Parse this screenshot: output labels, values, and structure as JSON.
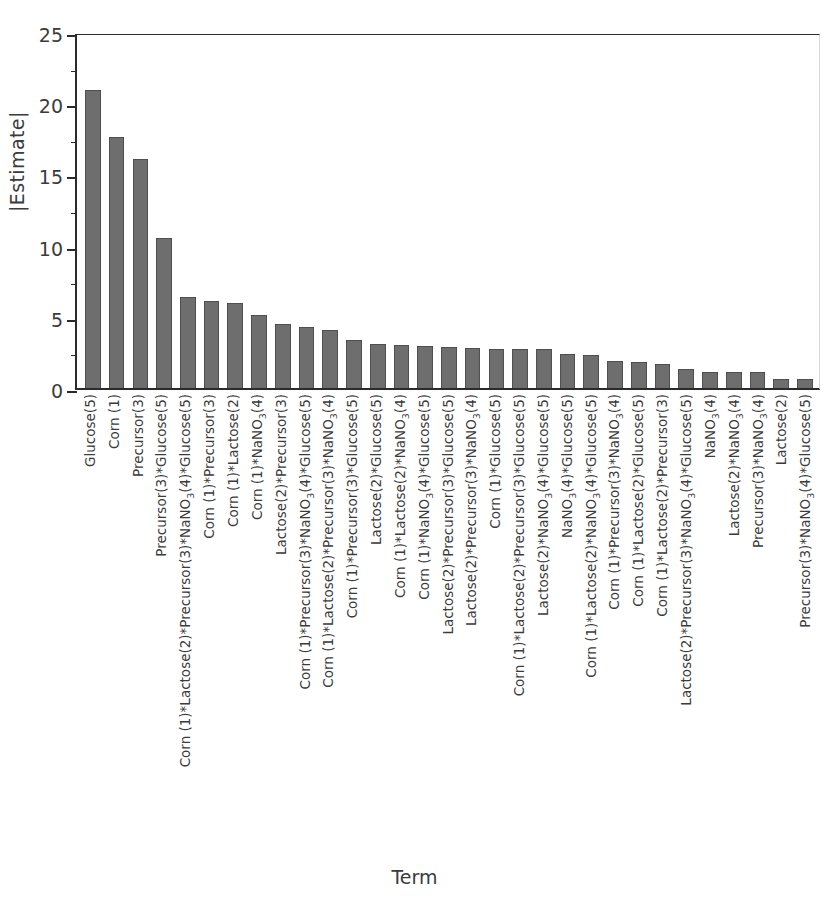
{
  "chart_data": {
    "type": "bar",
    "title": "",
    "xlabel": "Term",
    "ylabel": "|Estimate|",
    "ylim": [
      0,
      25
    ],
    "yticks": [
      0,
      5,
      10,
      15,
      20,
      25
    ],
    "yticks_minor": [
      2.5,
      7.5,
      12.5,
      17.5,
      22.5
    ],
    "grid": false,
    "legend": "none",
    "bar_color": "#6e6e6e",
    "categories": [
      "Glucose(5)",
      "Corn (1)",
      "Precursor(3)",
      "Precursor(3)*Glucose(5)",
      "Corn (1)*Lactose(2)*Precursor(3)*NaNO₃(4)*Glucose(5)",
      "Corn (1)*Precursor(3)",
      "Corn (1)*Lactose(2)",
      "Corn (1)*NaNO₃(4)",
      "Lactose(2)*Precursor(3)",
      "Corn (1)*Precursor(3)*NaNO₃(4)*Glucose(5)",
      "Corn (1)*Lactose(2)*Precursor(3)*NaNO₃(4)",
      "Corn (1)*Precursor(3)*Glucose(5)",
      "Lactose(2)*Glucose(5)",
      "Corn (1)*Lactose(2)*NaNO₃(4)",
      "Corn (1)*NaNO₃(4)*Glucose(5)",
      "Lactose(2)*Precursor(3)*Glucose(5)",
      "Lactose(2)*Precursor(3)*NaNO₃(4)",
      "Corn (1)*Glucose(5)",
      "Corn (1)*Lactose(2)*Precursor(3)*Glucose(5)",
      "Lactose(2)*NaNO₃(4)*Glucose(5)",
      "NaNO₃(4)*Glucose(5)",
      "Corn (1)*Lactose(2)*NaNO₃(4)*Glucose(5)",
      "Corn (1)*Precursor(3)*NaNO₃(4)",
      "Corn (1)*Lactose(2)*Glucose(5)",
      "Corn (1)*Lactose(2)*Precursor(3)",
      "Lactose(2)*Precursor(3)*NaNO₃(4)*Glucose(5)",
      "NaNO₃(4)",
      "Lactose(2)*NaNO₃(4)",
      "Precursor(3)*NaNO₃(4)",
      "Lactose(2)",
      "Precursor(3)*NaNO₃(4)*Glucose(5)"
    ],
    "values": [
      20.9,
      17.6,
      16.1,
      10.5,
      6.4,
      6.1,
      6.0,
      5.1,
      4.5,
      4.3,
      4.1,
      3.4,
      3.1,
      3.0,
      2.95,
      2.9,
      2.8,
      2.75,
      2.75,
      2.75,
      2.4,
      2.3,
      1.9,
      1.8,
      1.7,
      1.35,
      1.15,
      1.1,
      1.1,
      0.6,
      0.65
    ]
  }
}
